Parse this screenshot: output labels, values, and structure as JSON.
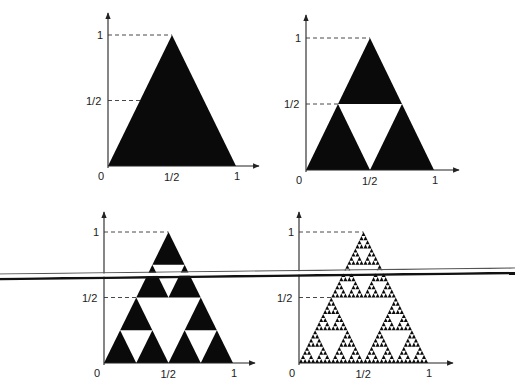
{
  "figure": {
    "colors": {
      "fill": "#0a0a0a",
      "background": "#ffffff",
      "axis": "#222222"
    },
    "panels": [
      {
        "id": "stage-0",
        "iterations": 0,
        "origin": [
          108,
          166
        ],
        "width": 128,
        "height": 131,
        "y_top": 13,
        "x_end": 259,
        "labels": {
          "origin": "0",
          "x_half": "1/2",
          "x_one": "1",
          "y_half": "1/2",
          "y_one": "1"
        }
      },
      {
        "id": "stage-1",
        "iterations": 1,
        "origin": [
          306,
          170
        ],
        "width": 128,
        "height": 132,
        "y_top": 15,
        "x_end": 459,
        "labels": {
          "origin": "0",
          "x_half": "1/2",
          "x_one": "1",
          "y_half": "1/2",
          "y_one": "1"
        }
      },
      {
        "id": "stage-2",
        "iterations": 2,
        "origin": [
          104,
          363
        ],
        "width": 129,
        "height": 131,
        "y_top": 212,
        "x_end": 255,
        "labels": {
          "origin": "0",
          "x_half": "1/2",
          "x_one": "1",
          "y_half": "1/2",
          "y_one": "1"
        }
      },
      {
        "id": "stage-5",
        "iterations": 5,
        "origin": [
          299,
          363
        ],
        "width": 129,
        "height": 131,
        "y_top": 212,
        "x_end": 453,
        "labels": {
          "origin": "0",
          "x_half": "1/2",
          "x_one": "1",
          "y_half": "1/2",
          "y_one": "1"
        }
      }
    ],
    "overlay_line": {
      "thin": {
        "x1": 0,
        "y1": 274,
        "x2": 515,
        "y2": 268,
        "width": 1.2,
        "color": "#555555"
      },
      "thick": {
        "x1": 0,
        "y1": 279,
        "x2": 515,
        "y2": 273,
        "width": 2.4,
        "color": "#111111"
      }
    }
  }
}
